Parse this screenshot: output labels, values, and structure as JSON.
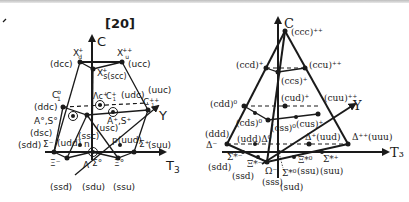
{
  "left_diagram": {
    "title": "[20]",
    "axes": {
      "vertical": "C",
      "diagonal": "Y",
      "horizontal": "T3"
    },
    "labels": {
      "dcc": "(dcc)",
      "Xd": "X",
      "Xd_sub": "d",
      "Xd_sup": "+",
      "Xu": "X",
      "Xu_sub": "u",
      "Xu_sup": "++",
      "ucc": "(ucc)",
      "Xs": "X",
      "Xs_sup": "+",
      "Xs_sub": "s(scc)",
      "uuc": "(uuc)",
      "C1_0": "C",
      "C1_0_sup": "o",
      "C1_0_sub": "1",
      "ddc": "(ddc)",
      "Lambda_c": "Λc",
      "Lambda_c_sup": "+",
      "C1p": "C",
      "C1p_sup": "+",
      "C1p_sub": "1",
      "udc": "(udc)",
      "C1pp": "C",
      "C1pp_sup": "++",
      "C1pp_sub": "1",
      "A0S0": "A°,S°",
      "ApSp": "A⁺,S⁺",
      "dsc": "(dsc)",
      "ssc": "(ssc)",
      "usc": "(usc)",
      "sdd": "(sdd)",
      "Sigma_minus": "Σ⁻",
      "udd": "(udd)",
      "n": "n",
      "p_uud": "p(uud)",
      "Sigma_plus": "Σ⁺",
      "suu": "(suu)",
      "Xi_minus": "Ξ⁻",
      "Lambda": "Λ",
      "Sigma0": "Σ°",
      "Xi0": "Ξ°",
      "bottom_row": [
        "(ssd)",
        "(sdu)",
        "(ssu)"
      ]
    }
  },
  "right_diagram": {
    "axes": {
      "vertical": "C",
      "diagonal": "Y",
      "horizontal": "T₃"
    },
    "labels": {
      "ccc": "(ccc)⁺⁺",
      "ccd": "(ccd)⁺",
      "ccu": "(ccu)⁺⁺",
      "ccs": "(ccs)⁺",
      "cud": "(cud)⁺",
      "cdd": "(cdd)⁰",
      "cuu": "(cuu)⁺⁺",
      "cds": "(cds)⁰",
      "css": "(css)⁰",
      "cus": "(cus)⁺",
      "ddd": "(ddd)",
      "Delta_minus": "Δ⁻",
      "udd_delta0": "(udd)Δ⁰",
      "Delta_plus_uud": "Δ⁺(uud)",
      "Delta_pp_uuu": "Δ⁺⁺(uuu)",
      "Sigma_star_minus": "Σ*⁻",
      "sdd": "(sdd)",
      "Xi_star_minus": "Ξ*⁻",
      "ssd": "(ssd)",
      "Omega_minus": "Ω⁻",
      "sss": "(sss)",
      "Sigma_star0": "Σ*⁰",
      "sud": "(sud)",
      "Xi_star0_ssu": "Ξ*⁰",
      "ssu": "(ssu)",
      "Sigma_star_plus": "Σ*⁺",
      "suu": "(suu)"
    }
  }
}
